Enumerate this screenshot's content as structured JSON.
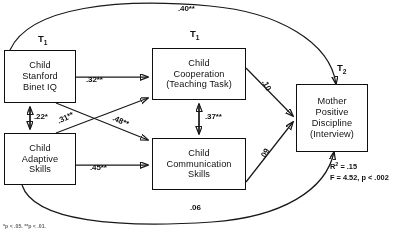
{
  "figure": {
    "type": "path-diagram",
    "accent_color": "#1a1a1a",
    "background_color": "#ffffff"
  },
  "time_labels": {
    "left": "T",
    "left_sub": "1",
    "middle": "T",
    "middle_sub": "1",
    "right": "T",
    "right_sub": "2"
  },
  "nodes": {
    "child_iq": {
      "line1": "Child",
      "line2": "Stanford",
      "line3": "Binet IQ"
    },
    "child_adaptive": {
      "line1": "Child",
      "line2": "Adaptive",
      "line3": "Skills"
    },
    "child_cooperation": {
      "line1": "Child",
      "line2": "Cooperation",
      "line3": "(Teaching Task)"
    },
    "child_communication": {
      "line1": "Child",
      "line2": "Communication",
      "line3": "Skills"
    },
    "mother_discipline": {
      "line1": "Mother",
      "line2": "Positive",
      "line3": "Discipline",
      "line4": "(Interview)"
    }
  },
  "coefficients": {
    "iq_to_mother_arc": ".40**",
    "adaptive_to_mother_arc": ".06",
    "iq_to_cooperation": ".32**",
    "adaptive_to_communication": ".45**",
    "iq_with_adaptive": ".22*",
    "cooperation_with_communication": ".37**",
    "adaptive_to_cooperation": ".31**",
    "iq_to_communication": ".48**",
    "cooperation_to_mother": ".10",
    "communication_to_mother": ".09"
  },
  "statistics": {
    "r_squared_label": "R",
    "r_squared_exponent": "2",
    "r_squared_value": "= .15",
    "f_line": "F = 4.52, p < .002"
  },
  "footnote": {
    "text": "*p < .05. **p < .01."
  }
}
